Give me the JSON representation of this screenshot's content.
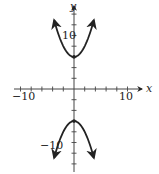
{
  "chart_data": {
    "type": "line",
    "title": "",
    "xlabel": "x",
    "ylabel": "y",
    "xlim": [
      -10,
      10
    ],
    "ylim": [
      -14,
      14
    ],
    "x_tick_step": 2,
    "y_tick_step": 2,
    "x_tick_labels": [
      "-10",
      "10"
    ],
    "y_tick_labels": [
      "10",
      "-10"
    ],
    "grid": false,
    "series": [
      {
        "name": "upper branch",
        "x": [
          -3.7,
          -3,
          -2,
          -1,
          0,
          1,
          2,
          3,
          3.7
        ],
        "y": [
          12.8,
          10.5,
          8,
          6.5,
          6,
          6.5,
          8,
          10.5,
          12.8
        ],
        "vertex": [
          0,
          6
        ],
        "arrows_at_ends": true
      },
      {
        "name": "lower branch",
        "x": [
          -3.7,
          -3,
          -2,
          -1,
          0,
          1,
          2,
          3,
          3.7
        ],
        "y": [
          -12.8,
          -10.5,
          -8,
          -6.5,
          -6,
          -6.5,
          -8,
          -10.5,
          -12.8
        ],
        "vertex": [
          0,
          -6
        ],
        "arrows_at_ends": true
      }
    ],
    "color": "#222222"
  },
  "labels": {
    "x_axis": "x",
    "y_axis": "y",
    "x_min": "−10",
    "x_max": "10",
    "y_max": "10",
    "y_min": "−10"
  }
}
